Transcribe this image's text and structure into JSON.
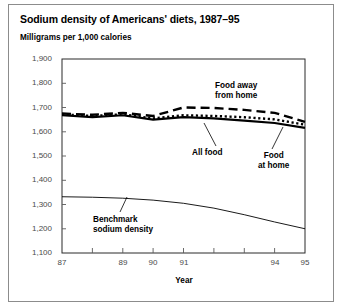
{
  "figure": {
    "title": "Sodium density of Americans' diets, 1987–95",
    "unit_label": "Milligrams per 1,000 calories",
    "border_color": "#8c8c8c"
  },
  "annotations": {
    "food_away_line1": "Food away",
    "food_away_line2": "from home",
    "all_food": "All food",
    "food_at_home_line1": "Food",
    "food_at_home_line2": "at home",
    "benchmark_line1": "Benchmark",
    "benchmark_line2": "sodium density"
  },
  "chart_data": {
    "type": "line",
    "title": "Sodium density of Americans' diets, 1987–95",
    "subtitle": "Milligrams per 1,000 calories",
    "xlabel": "Year",
    "ylabel": "Milligrams per 1,000 calories",
    "x": [
      87,
      88,
      89,
      90,
      91,
      92,
      93,
      94,
      95
    ],
    "xtick_labels": [
      "87",
      "",
      "89",
      "90",
      "91",
      "",
      "",
      "94",
      "95"
    ],
    "xlim": [
      87,
      95
    ],
    "ylim": [
      1100,
      1900
    ],
    "ytick_labels": [
      "1,900",
      "1,800",
      "1,700",
      "1,600",
      "1,500",
      "1,400",
      "1,300",
      "1,200",
      "1,100"
    ],
    "yticks": [
      1900,
      1800,
      1700,
      1600,
      1500,
      1400,
      1300,
      1200,
      1100
    ],
    "grid": false,
    "legend": "inline-annotations",
    "series": [
      {
        "name": "Food away from home",
        "style": "dashed",
        "values": [
          1675,
          1670,
          1678,
          1665,
          1700,
          1698,
          1690,
          1678,
          1641
        ]
      },
      {
        "name": "All food",
        "style": "dotted",
        "values": [
          1672,
          1665,
          1672,
          1655,
          1668,
          1665,
          1660,
          1651,
          1629
        ]
      },
      {
        "name": "Food at home",
        "style": "solid",
        "values": [
          1668,
          1660,
          1668,
          1650,
          1660,
          1655,
          1646,
          1636,
          1616
        ]
      },
      {
        "name": "Benchmark sodium density",
        "style": "solid-thin",
        "values": [
          1332,
          1330,
          1326,
          1318,
          1305,
          1285,
          1258,
          1228,
          1200
        ]
      }
    ]
  }
}
